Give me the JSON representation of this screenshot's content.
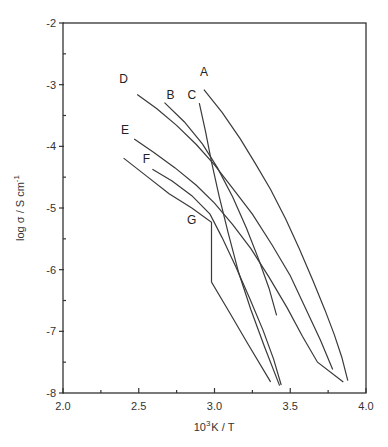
{
  "chart_data": {
    "type": "line",
    "title": "",
    "xlabel": "10³K / T",
    "xlabel_base": "10",
    "xlabel_sup": "3",
    "xlabel_rest": "K / T",
    "ylabel": "log σ / S cm⁻¹",
    "ylabel_main": "log σ / S cm",
    "ylabel_sup": "-1",
    "xlim": [
      2.0,
      4.0
    ],
    "ylim": [
      -8,
      -2
    ],
    "xticks": [
      2.0,
      2.5,
      3.0,
      3.5,
      4.0
    ],
    "xtick_labels": [
      "2.0",
      "2.5",
      "3.0",
      "3.5",
      "4.0"
    ],
    "xminor": [
      2.25,
      2.75,
      3.25,
      3.75
    ],
    "yticks": [
      -2,
      -3,
      -4,
      -5,
      -6,
      -7,
      -8
    ],
    "ytick_labels": [
      "-2",
      "-3",
      "-4",
      "-5",
      "-6",
      "-7",
      "-8"
    ],
    "yminor": [
      -2.5,
      -3.5,
      -4.5,
      -5.5,
      -6.5,
      -7.5
    ],
    "grid": false,
    "legend": "none (curves labelled directly)",
    "series": [
      {
        "name": "A",
        "label_at": [
          2.93,
          -2.86
        ],
        "points": [
          [
            2.93,
            -3.08
          ],
          [
            3.05,
            -3.45
          ],
          [
            3.17,
            -3.88
          ],
          [
            3.27,
            -4.28
          ],
          [
            3.37,
            -4.7
          ],
          [
            3.47,
            -5.18
          ],
          [
            3.56,
            -5.66
          ],
          [
            3.65,
            -6.18
          ],
          [
            3.73,
            -6.66
          ],
          [
            3.79,
            -7.05
          ],
          [
            3.84,
            -7.42
          ],
          [
            3.88,
            -7.8
          ]
        ]
      },
      {
        "name": "B",
        "label_at": [
          2.71,
          -3.24
        ],
        "points": [
          [
            2.67,
            -3.29
          ],
          [
            2.8,
            -3.6
          ],
          [
            2.92,
            -3.96
          ],
          [
            3.02,
            -4.35
          ],
          [
            3.12,
            -4.82
          ],
          [
            3.21,
            -5.32
          ],
          [
            3.29,
            -5.82
          ],
          [
            3.36,
            -6.3
          ],
          [
            3.41,
            -6.74
          ]
        ]
      },
      {
        "name": "C",
        "label_at": [
          2.85,
          -3.24
        ],
        "points": [
          [
            2.9,
            -3.3
          ],
          [
            2.94,
            -3.75
          ],
          [
            2.98,
            -4.25
          ],
          [
            3.03,
            -4.8
          ],
          [
            3.09,
            -5.4
          ],
          [
            3.16,
            -6.05
          ],
          [
            3.24,
            -6.65
          ],
          [
            3.33,
            -7.25
          ],
          [
            3.43,
            -7.88
          ]
        ]
      },
      {
        "name": "D",
        "label_at": [
          2.4,
          -2.98
        ],
        "points": [
          [
            2.49,
            -3.16
          ],
          [
            2.62,
            -3.39
          ],
          [
            2.75,
            -3.66
          ],
          [
            2.88,
            -3.97
          ],
          [
            3.0,
            -4.3
          ],
          [
            3.12,
            -4.68
          ],
          [
            3.25,
            -5.1
          ],
          [
            3.38,
            -5.6
          ],
          [
            3.5,
            -6.1
          ],
          [
            3.6,
            -6.62
          ],
          [
            3.7,
            -7.15
          ],
          [
            3.78,
            -7.62
          ]
        ]
      },
      {
        "name": "E",
        "label_at": [
          2.41,
          -3.8
        ],
        "points": [
          [
            2.47,
            -3.88
          ],
          [
            2.6,
            -4.1
          ],
          [
            2.74,
            -4.35
          ],
          [
            2.88,
            -4.63
          ],
          [
            3.0,
            -4.92
          ],
          [
            3.12,
            -5.27
          ],
          [
            3.24,
            -5.66
          ],
          [
            3.36,
            -6.12
          ],
          [
            3.48,
            -6.62
          ],
          [
            3.58,
            -7.08
          ],
          [
            3.68,
            -7.5
          ],
          [
            3.85,
            -7.82
          ]
        ]
      },
      {
        "name": "F",
        "label_at": [
          2.55,
          -4.27
        ],
        "points": [
          [
            2.59,
            -4.37
          ],
          [
            2.72,
            -4.56
          ],
          [
            2.85,
            -4.8
          ],
          [
            2.97,
            -5.1
          ],
          [
            3.05,
            -5.48
          ],
          [
            3.14,
            -5.95
          ],
          [
            3.23,
            -6.45
          ],
          [
            3.32,
            -6.98
          ],
          [
            3.39,
            -7.45
          ],
          [
            3.44,
            -7.87
          ]
        ]
      },
      {
        "name": "G",
        "label_at": [
          2.85,
          -5.26
        ],
        "points": [
          [
            2.4,
            -4.19
          ],
          [
            2.55,
            -4.48
          ],
          [
            2.7,
            -4.77
          ],
          [
            2.85,
            -5.0
          ],
          [
            2.98,
            -5.23
          ],
          [
            2.98,
            -6.2
          ],
          [
            3.1,
            -6.7
          ],
          [
            3.22,
            -7.2
          ],
          [
            3.37,
            -7.82
          ]
        ]
      }
    ]
  }
}
